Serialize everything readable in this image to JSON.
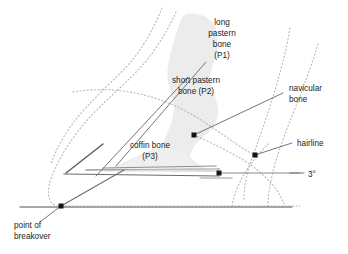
{
  "diagram": {
    "background_color": "#ffffff"
  },
  "palette": {
    "outline_dotted": "#b9b9b9",
    "bone_silhouette": "#ececec",
    "leader_line": "#6e6e6e",
    "solid_dark_line": "#4a4a4a",
    "ground_line": "#8a8a8a",
    "marker": "#151515",
    "text": "#1b1b1b"
  },
  "labels": {
    "long_pastern": {
      "line1": "long",
      "line2": "pastern",
      "line3": "bone",
      "line4": "(P1)"
    },
    "short_pastern": {
      "line1": "short pastern",
      "line2": "bone (P2)"
    },
    "coffin_bone": {
      "line1": "coffin bone",
      "line2": "(P3)"
    },
    "navicular_bone": {
      "line1": "navicular",
      "line2": "bone"
    },
    "hairline": {
      "line1": "hairline"
    },
    "palmar_angle": {
      "value": "3°"
    },
    "point_of_breakover": {
      "line1": "point of",
      "line2": "breakover"
    }
  },
  "markers": [
    {
      "name": "navicular-bone-marker",
      "x": 194,
      "y": 135
    },
    {
      "name": "hairline-marker",
      "x": 255,
      "y": 155
    },
    {
      "name": "palmar-angle-marker",
      "x": 219,
      "y": 173
    },
    {
      "name": "point-of-breakover-marker",
      "x": 61,
      "y": 206
    }
  ],
  "measurements": {
    "palmar_angle_degrees": 3,
    "ground_line_y": 206
  }
}
